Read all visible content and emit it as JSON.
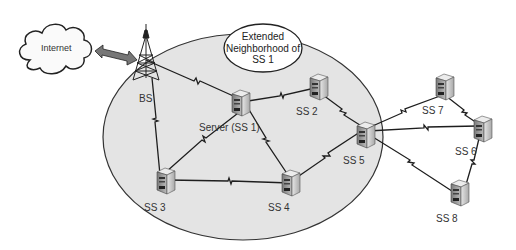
{
  "diagram": {
    "type": "network-topology",
    "internet": {
      "label": "Internet"
    },
    "base_station": {
      "label": "BS"
    },
    "callout": {
      "line1": "Extended",
      "line2": "Neighborhood of",
      "line3": "SS 1"
    },
    "nodes": [
      {
        "id": "ss1",
        "label": "Server (SS 1)"
      },
      {
        "id": "ss2",
        "label": "SS 2"
      },
      {
        "id": "ss3",
        "label": "SS 3"
      },
      {
        "id": "ss4",
        "label": "SS 4"
      },
      {
        "id": "ss5",
        "label": "SS 5"
      },
      {
        "id": "ss6",
        "label": "SS 6"
      },
      {
        "id": "ss7",
        "label": "SS 7"
      },
      {
        "id": "ss8",
        "label": "SS 8"
      }
    ],
    "links": [
      [
        "Internet",
        "BS",
        "wired-bidirectional"
      ],
      [
        "BS",
        "SS 1"
      ],
      [
        "BS",
        "SS 3"
      ],
      [
        "SS 1",
        "SS 2"
      ],
      [
        "SS 1",
        "SS 3"
      ],
      [
        "SS 1",
        "SS 4"
      ],
      [
        "SS 3",
        "SS 4"
      ],
      [
        "SS 2",
        "SS 5"
      ],
      [
        "SS 4",
        "SS 5"
      ],
      [
        "SS 5",
        "SS 7"
      ],
      [
        "SS 5",
        "SS 6"
      ],
      [
        "SS 5",
        "SS 8"
      ],
      [
        "SS 7",
        "SS 6"
      ],
      [
        "SS 6",
        "SS 8"
      ]
    ],
    "colors": {
      "neighborhood_fill": "#e4e4e4",
      "line": "#1e1e1e",
      "server_body": "#d8d8d8"
    }
  }
}
